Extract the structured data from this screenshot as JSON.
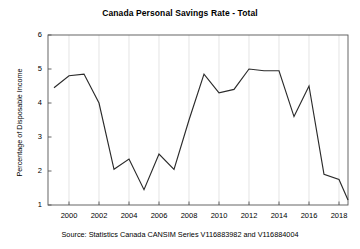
{
  "chart_data": {
    "type": "line",
    "title": "Canada Personal Savings Rate - Total",
    "xlabel": "",
    "ylabel": "Percentage of Disposable Income",
    "source": "Source: Statistics Canada CANSIM Series V116883982 and V116884004",
    "xlim": [
      1998.6,
      2018.6
    ],
    "ylim": [
      1,
      6
    ],
    "yticks": [
      1,
      2,
      3,
      4,
      5,
      6
    ],
    "ytick_labels": [
      "1",
      "2",
      "3",
      "4",
      "5",
      "6"
    ],
    "xticks": [
      2000,
      2002,
      2004,
      2006,
      2008,
      2010,
      2012,
      2014,
      2016,
      2018
    ],
    "xtick_labels": [
      "2000",
      "2002",
      "2004",
      "2006",
      "2008",
      "2010",
      "2012",
      "2014",
      "2016",
      "2018"
    ],
    "grid": "vertical",
    "legend": "none",
    "line_color": "#2b2b2b",
    "grid_color": "#d9d9d9",
    "x": [
      1999,
      2000,
      2001,
      2002,
      2003,
      2004,
      2005,
      2006,
      2007,
      2008,
      2009,
      2010,
      2011,
      2012,
      2013,
      2014,
      2015,
      2016,
      2017,
      2018
    ],
    "values": [
      4.45,
      4.8,
      4.85,
      4.0,
      2.05,
      2.35,
      1.45,
      2.5,
      2.05,
      3.5,
      4.85,
      4.3,
      4.4,
      5.0,
      4.95,
      4.95,
      3.6,
      4.5,
      1.9,
      1.75
    ],
    "series": [
      {
        "name": "Canada Personal Savings Rate - Total",
        "values": [
          4.45,
          4.8,
          4.85,
          4.0,
          2.05,
          2.35,
          1.45,
          2.5,
          2.05,
          3.5,
          4.85,
          4.3,
          4.4,
          5.0,
          4.95,
          4.95,
          3.6,
          4.5,
          1.9,
          1.75
        ]
      }
    ],
    "final_point": {
      "x": 2018.6,
      "y": 1.15
    }
  }
}
